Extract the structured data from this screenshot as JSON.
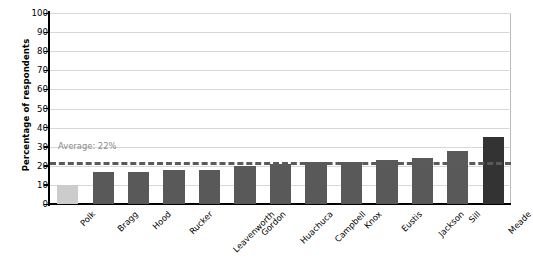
{
  "chart_data": {
    "type": "bar",
    "title": "",
    "xlabel": "",
    "ylabel": "Percentage of respondents",
    "ylim": [
      0,
      100
    ],
    "ytick_step": 10,
    "yticks": [
      100,
      90,
      80,
      70,
      60,
      50,
      40,
      30,
      20,
      10,
      0
    ],
    "grid": true,
    "legend": "none",
    "categories": [
      "Polk",
      "Bragg",
      "Hood",
      "Rucker",
      "Leavenworth",
      "Gordon",
      "Huachuca",
      "Campbell",
      "Knox",
      "Eustis",
      "Jackson",
      "Sill",
      "Meade"
    ],
    "values": [
      10,
      17,
      17,
      18,
      18,
      20,
      21,
      22,
      22,
      23,
      24,
      28,
      35
    ],
    "bar_colors": [
      "#cccccc",
      "#595959",
      "#595959",
      "#595959",
      "#595959",
      "#595959",
      "#595959",
      "#595959",
      "#595959",
      "#595959",
      "#595959",
      "#595959",
      "#333333"
    ],
    "annotations": [
      {
        "name": "average-line",
        "label": "Average: 22%",
        "value": 22,
        "style": "dashed",
        "color": "#5a5a5a",
        "label_color": "#8a8a8a"
      }
    ]
  },
  "axis": {
    "y_title": "Percentage of respondents"
  },
  "colors": {
    "bar_default": "#595959",
    "bar_highlight_light": "#cccccc",
    "bar_highlight_dark": "#333333",
    "gridline": "#d8d8d8",
    "axis": "#000000",
    "average_line": "#5a5a5a",
    "average_label": "#8a8a8a",
    "plot_border": "#b9b9b9",
    "background": "#ffffff"
  }
}
